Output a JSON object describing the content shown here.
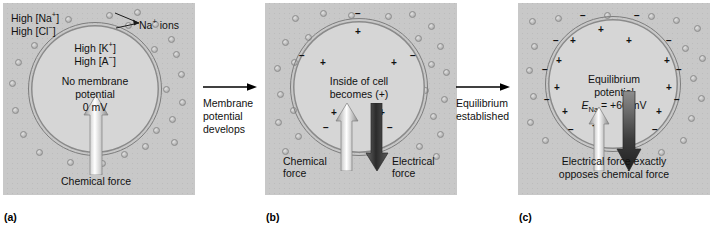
{
  "figure": {
    "title_semantic": "sodium-equilibrium-potential-three-stage-diagram"
  },
  "panels": [
    {
      "letter": "(a)",
      "extracellular_labels": [
        "High [Na+]",
        "High [Cl−]"
      ],
      "ion_callout": "Na+ ions",
      "intracellular_labels": [
        "High [K+]",
        "High [A−]"
      ],
      "center_text": [
        "No membrane",
        "potential",
        "0 mV"
      ],
      "chemical_force_label": "Chemical force",
      "electrical_force_label": "",
      "membrane_charges_outside": [],
      "membrane_charges_inside": []
    },
    {
      "letter": "(b)",
      "extracellular_labels": [],
      "ion_callout": "",
      "intracellular_labels": [],
      "center_text": [
        "Inside of cell",
        "becomes (+)"
      ],
      "chemical_force_label": "Chemical\nforce",
      "chemical_force_line1": "Chemical",
      "chemical_force_line2": "force",
      "electrical_force_line1": "Electrical",
      "electrical_force_line2": "force",
      "membrane_charges_outside": [
        "−",
        "−",
        "−",
        "−",
        "−"
      ],
      "membrane_charges_inside": [
        "+",
        "+",
        "+",
        "+",
        "+"
      ]
    },
    {
      "letter": "(c)",
      "extracellular_labels": [],
      "ion_callout": "",
      "intracellular_labels": [],
      "center_text_line1": "Equilibrium",
      "center_text_line2": "potential",
      "center_text_line3_prefix": "E",
      "center_text_line3_sub": "Na",
      "center_text_line3_value": " = +60 mV",
      "bottom_caption_line1": "Electrical force exactly",
      "bottom_caption_line2": "opposes chemical force",
      "membrane_charges_outside": [
        "−",
        "−",
        "−",
        "−",
        "−",
        "−",
        "−",
        "−",
        "−",
        "−"
      ],
      "membrane_charges_inside": [
        "+",
        "+",
        "+",
        "+",
        "+",
        "+",
        "+",
        "+",
        "+",
        "+"
      ]
    }
  ],
  "transitions": [
    {
      "caption_line1": "Membrane",
      "caption_line2": "potential",
      "caption_line3": "develops"
    },
    {
      "caption_line1": "Equilibrium",
      "caption_line2": "established",
      "caption_line3": ""
    }
  ],
  "labels": {
    "na_ions": "Na",
    "na_ions_sup": "+",
    "na_ions_tail": " ions",
    "high_na_prefix": "High [Na",
    "high_na_sup": "+",
    "high_na_tail": "]",
    "high_cl_prefix": "High [Cl",
    "high_cl_sup": "−",
    "high_cl_tail": "]",
    "high_k_prefix": "High [K",
    "high_k_sup": "+",
    "high_k_tail": "]",
    "high_a_prefix": "High [A",
    "high_a_sup": "−",
    "high_a_tail": "]"
  },
  "colors": {
    "panel_background": "#c8c8c8",
    "cell_interior": "#d6d6d6",
    "membrane_stroke": "#7d7d7d",
    "ion_fill": "#bdbdbd",
    "chemical_arrow_light": "#f2f2f2",
    "chemical_arrow_mid": "#a8a8a8",
    "electrical_arrow_dark": "#3a3a3a",
    "text": "#111111"
  }
}
